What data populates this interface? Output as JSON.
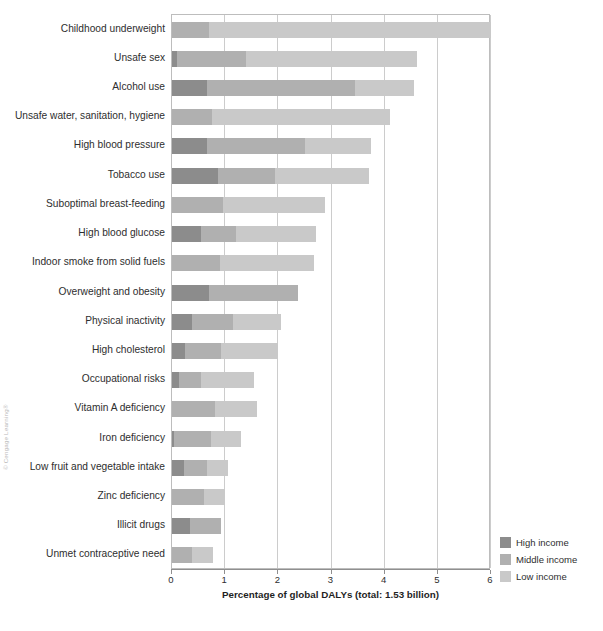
{
  "credit": "© Cengage Learning®",
  "chart_data": {
    "type": "bar",
    "orientation": "horizontal",
    "stacked": true,
    "title": "",
    "xlabel": "Percentage of global DALYs (total: 1.53 billion)",
    "ylabel": "",
    "xlim": [
      0,
      6
    ],
    "xticks": [
      "0",
      "1",
      "2",
      "3",
      "4",
      "5",
      "6"
    ],
    "grid": "vertical",
    "legend_position": "bottom-right",
    "categories": [
      "Childhood underweight",
      "Unsafe sex",
      "Alcohol use",
      "Unsafe water, sanitation, hygiene",
      "High blood pressure",
      "Tobacco use",
      "Suboptimal breast-feeding",
      "High blood glucose",
      "Indoor smoke from solid fuels",
      "Overweight and obesity",
      "Physical inactivity",
      "High cholesterol",
      "Occupational risks",
      "Vitamin A deficiency",
      "Iron deficiency",
      "Low fruit and vegetable intake",
      "Zinc deficiency",
      "Illicit drugs",
      "Unmet contraceptive need"
    ],
    "series": [
      {
        "name": "High income",
        "color": "#8c8c8c",
        "values": [
          0.0,
          0.1,
          0.65,
          0.0,
          0.65,
          0.87,
          0.0,
          0.55,
          0.0,
          0.7,
          0.38,
          0.25,
          0.13,
          0.0,
          0.04,
          0.23,
          0.0,
          0.33,
          0.0
        ]
      },
      {
        "name": "Middle income",
        "color": "#b0b0b0",
        "values": [
          0.7,
          1.3,
          2.8,
          0.75,
          1.85,
          1.07,
          0.95,
          0.65,
          0.9,
          1.67,
          0.77,
          0.67,
          0.42,
          0.8,
          0.7,
          0.42,
          0.6,
          0.59,
          0.37
        ]
      },
      {
        "name": "Low income",
        "color": "#c9c9c9",
        "values": [
          5.3,
          3.2,
          1.1,
          3.35,
          1.25,
          1.76,
          1.92,
          1.5,
          1.77,
          0.0,
          0.9,
          1.08,
          1.0,
          0.8,
          0.56,
          0.4,
          0.4,
          0.0,
          0.4
        ]
      }
    ],
    "totals": [
      6.0,
      4.6,
      4.55,
      4.1,
      3.75,
      3.7,
      2.87,
      2.7,
      2.67,
      2.37,
      2.05,
      2.0,
      1.55,
      1.6,
      1.3,
      1.05,
      1.0,
      0.92,
      0.77
    ]
  }
}
